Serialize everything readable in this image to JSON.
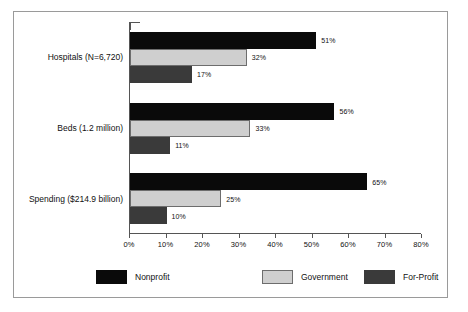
{
  "chart_data": {
    "type": "bar",
    "orientation": "horizontal",
    "title": "",
    "subtitle": "",
    "xlabel": "",
    "ylabel": "",
    "xlim": [
      0,
      80
    ],
    "xticks": [
      "0%",
      "10%",
      "20%",
      "30%",
      "40%",
      "50%",
      "60%",
      "70%",
      "80%"
    ],
    "xtick_values": [
      0,
      10,
      20,
      30,
      40,
      50,
      60,
      70,
      80
    ],
    "grid": false,
    "legend_position": "bottom",
    "categories": [
      "Hospitals (N=6,720)",
      "Beds (1.2 million)",
      "Spending ($214.9 billion)"
    ],
    "series": [
      {
        "name": "Nonprofit",
        "color": "#0a0a0a",
        "values": [
          51,
          56,
          65
        ],
        "labels": [
          "51%",
          "56%",
          "65%"
        ]
      },
      {
        "name": "Government",
        "color": "#cfcfcf",
        "values": [
          32,
          33,
          25
        ],
        "labels": [
          "32%",
          "33%",
          "25%"
        ]
      },
      {
        "name": "For-Profit",
        "color": "#3a3a3a",
        "values": [
          17,
          11,
          10
        ],
        "labels": [
          "17%",
          "11%",
          "10%"
        ]
      }
    ]
  },
  "legend": {
    "items": [
      {
        "label": "Nonprofit"
      },
      {
        "label": "Government"
      },
      {
        "label": "For-Profit"
      }
    ]
  }
}
